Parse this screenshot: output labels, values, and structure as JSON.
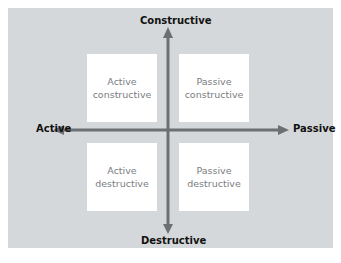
{
  "diagram": {
    "axes": {
      "top": "Constructive",
      "bottom": "Destructive",
      "left": "Active",
      "right": "Passive"
    },
    "quadrants": [
      {
        "line1": "Active",
        "line2": "constructive"
      },
      {
        "line1": "Passive",
        "line2": "constructive"
      },
      {
        "line1": "Active",
        "line2": "destructive"
      },
      {
        "line1": "Passive",
        "line2": "destructive"
      }
    ],
    "colors": {
      "panel": "#d5d8da",
      "box": "#ffffff",
      "arrow": "#6d6f72",
      "label": "#111111",
      "box_text": "#7a7d80"
    }
  }
}
